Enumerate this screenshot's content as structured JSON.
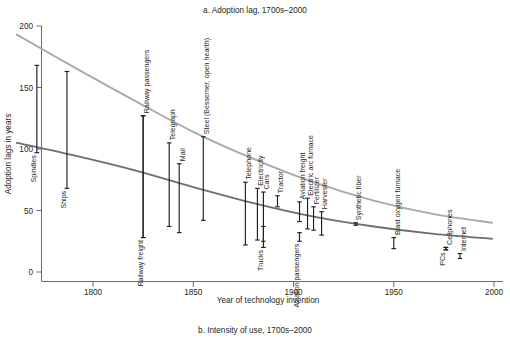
{
  "figure": {
    "title": "a. Adoption lag, 1700s–2000",
    "caption": "b. Intensity of use, 1700s–2000",
    "xlabel": "Year of technology invention",
    "ylabel": "Adoption lags in years"
  },
  "colors": {
    "background": "#ffffff",
    "text": "#231f20",
    "axis": "#58595b",
    "errorbar": "#231f20",
    "trend_upper": "#a7a9ac",
    "trend_lower": "#6d6e71"
  },
  "chart_data": {
    "type": "scatter",
    "title": "a. Adoption lag, 1700s–2000",
    "subtitle": "b. Intensity of use, 1700s–2000",
    "xlabel": "Year of technology invention",
    "ylabel": "Adoption lags in years",
    "xlim": [
      1750,
      2000
    ],
    "ylim": [
      0,
      200
    ],
    "xticks": [
      1800,
      1850,
      1900,
      1950,
      2000
    ],
    "yticks": [
      0,
      50,
      100,
      150,
      200
    ],
    "grid": false,
    "legend": "none",
    "point_style": "vertical-range-bars-with-caps",
    "points": [
      {
        "label": "Spindles",
        "year": 1772,
        "low": 97,
        "high": 168,
        "label_side": "left"
      },
      {
        "label": "Ships",
        "year": 1787,
        "low": 68,
        "high": 163,
        "label_side": "left"
      },
      {
        "label": "Railway freight",
        "year": 1825,
        "low": 28,
        "high": 127,
        "label_side": "left"
      },
      {
        "label": "Railway passengers",
        "year": 1825,
        "low": 28,
        "high": 127,
        "label_side": "right"
      },
      {
        "label": "Telegraph",
        "year": 1838,
        "low": 37,
        "high": 105,
        "label_side": "right"
      },
      {
        "label": "Mail",
        "year": 1843,
        "low": 32,
        "high": 88,
        "label_side": "right"
      },
      {
        "label": "Steel (Bessemer, open hearth)",
        "year": 1855,
        "low": 42,
        "high": 110,
        "label_side": "right"
      },
      {
        "label": "Telephone",
        "year": 1876,
        "low": 22,
        "high": 73,
        "label_side": "right"
      },
      {
        "label": "Electricity",
        "year": 1882,
        "low": 26,
        "high": 68,
        "label_side": "right"
      },
      {
        "label": "Cars",
        "year": 1885,
        "low": 25,
        "high": 65,
        "label_side": "right"
      },
      {
        "label": "Trucks",
        "year": 1885,
        "low": 20,
        "high": 37,
        "label_side": "left"
      },
      {
        "label": "Tractor",
        "year": 1892,
        "low": 53,
        "high": 62,
        "label_side": "right"
      },
      {
        "label": "Aviation passengers",
        "year": 1903,
        "low": 25,
        "high": 32,
        "label_side": "left"
      },
      {
        "label": "Aviation freight",
        "year": 1903,
        "low": 41,
        "high": 57,
        "label_side": "right"
      },
      {
        "label": "Electric arc furnace",
        "year": 1907,
        "low": 35,
        "high": 60,
        "label_side": "right"
      },
      {
        "label": "Fertilizer",
        "year": 1910,
        "low": 34,
        "high": 53,
        "label_side": "right"
      },
      {
        "label": "Harvester",
        "year": 1914,
        "low": 30,
        "high": 49,
        "label_side": "right"
      },
      {
        "label": "Synthetic fiber",
        "year": 1931,
        "low": 38,
        "high": 40,
        "label_side": "right"
      },
      {
        "label": "Blast oxygen furnace",
        "year": 1950,
        "low": 19,
        "high": 28,
        "label_side": "right"
      },
      {
        "label": "PCs",
        "year": 1976,
        "low": 18,
        "high": 20,
        "label_side": "left"
      },
      {
        "label": "Cellphones",
        "year": 1976,
        "low": 18,
        "high": 20,
        "label_side": "right"
      },
      {
        "label": "Internet",
        "year": 1983,
        "low": 11,
        "high": 15,
        "label_side": "right"
      }
    ],
    "series": [
      {
        "name": "upper trend",
        "color": "#a7a9ac",
        "x": [
          1762,
          1790,
          1820,
          1850,
          1880,
          1910,
          1940,
          1970,
          1999
        ],
        "y": [
          193,
          167,
          140,
          114,
          92,
          73,
          58,
          47,
          40
        ]
      },
      {
        "name": "lower trend",
        "color": "#6d6e71",
        "x": [
          1762,
          1790,
          1820,
          1850,
          1880,
          1910,
          1940,
          1970,
          1999
        ],
        "y": [
          105,
          95,
          83,
          69,
          56,
          45,
          37,
          31,
          27
        ]
      }
    ]
  }
}
